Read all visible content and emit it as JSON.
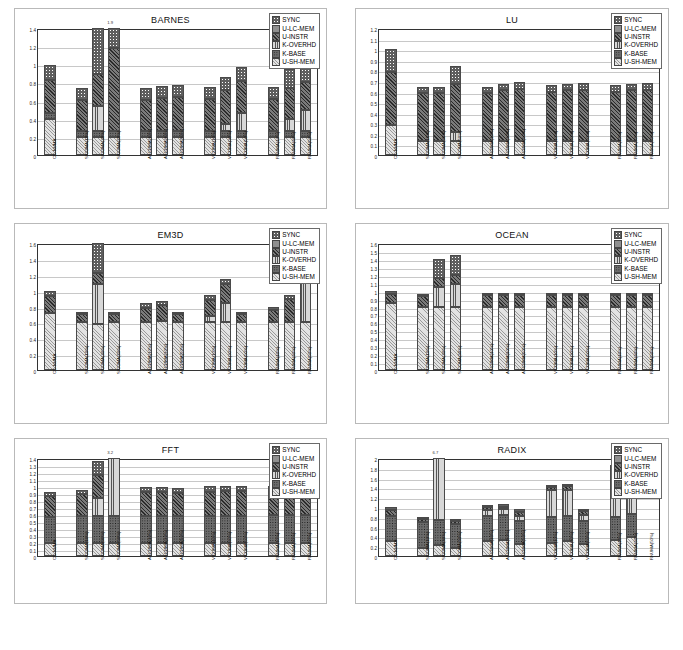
{
  "figure": {
    "background": "#ffffff",
    "panel_border": "#b9b9b9",
    "axis_color": "#333333",
    "gridline_color": "#c8c8c8"
  },
  "legend": {
    "entries": [
      {
        "key": "sync",
        "label": "SYNC",
        "swatch": "p-sync"
      },
      {
        "key": "ulc",
        "label": "U-LC-MEM",
        "swatch": "p-ulc"
      },
      {
        "key": "uin",
        "label": "U-INSTR",
        "swatch": "p-uin"
      },
      {
        "key": "kov",
        "label": "K-OVERHD",
        "swatch": "p-kov"
      },
      {
        "key": "kba",
        "label": "K-BASE",
        "swatch": "p-kba"
      },
      {
        "key": "ush",
        "label": "U-SH-MEM",
        "swatch": "p-ush"
      }
    ]
  },
  "categories": [
    "CC-NUMA",
    "SICOMA(10%)",
    "SICOMA(30%)",
    "SICOMA(50%)",
    "ASCOMA(10%)",
    "ASCOMA(30%)",
    "ASCOMA(50%)",
    "VICUMA(10%)",
    "VICUMA(30%)",
    "VICUMA(50%)",
    "RNUMA(10%)",
    "RNUMA(30%)",
    "RNUMA(50%)"
  ],
  "group_breaks": [
    1,
    4,
    7,
    10
  ],
  "chart_data": [
    {
      "type": "bar",
      "title": "BARNES",
      "xlabel": "",
      "ylabel": "",
      "ylim": [
        0,
        1.4
      ],
      "yticks": [
        0,
        0.2,
        0.4,
        0.6,
        0.8,
        1,
        1.2,
        1.4
      ],
      "ytick_labels": [
        "0",
        "0.2",
        "0.4",
        "0.6",
        "0.8",
        "1",
        "1.2",
        "1.4"
      ],
      "grid": true,
      "stacked": true,
      "series_order": [
        "ush",
        "kba",
        "kov",
        "uin",
        "ulc",
        "sync"
      ],
      "annotations": [
        {
          "text": "1.9",
          "category_index": 3
        }
      ],
      "categories": [
        "CC-NUMA",
        "SICOMA(10%)",
        "SICOMA(30%)",
        "SICOMA(50%)",
        "ASCOMA(10%)",
        "ASCOMA(30%)",
        "ASCOMA(50%)",
        "VICUMA(10%)",
        "VICUMA(30%)",
        "VICUMA(50%)",
        "RNUMA(10%)",
        "RNUMA(30%)",
        "RNUMA(50%)"
      ],
      "series": [
        {
          "name": "U-SH-MEM",
          "key": "ush",
          "values": [
            0.4,
            0.2,
            0.2,
            0.2,
            0.2,
            0.2,
            0.2,
            0.2,
            0.2,
            0.2,
            0.2,
            0.2,
            0.2
          ]
        },
        {
          "name": "K-BASE",
          "key": "kba",
          "values": [
            0.06,
            0.06,
            0.06,
            0.06,
            0.06,
            0.06,
            0.06,
            0.06,
            0.06,
            0.06,
            0.06,
            0.06,
            0.06
          ]
        },
        {
          "name": "K-OVERHD",
          "key": "kov",
          "values": [
            0.0,
            0.0,
            0.28,
            0.0,
            0.0,
            0.0,
            0.0,
            0.0,
            0.08,
            0.2,
            0.0,
            0.14,
            0.24
          ]
        },
        {
          "name": "U-INSTR",
          "key": "uin",
          "values": [
            0.37,
            0.35,
            0.35,
            0.92,
            0.35,
            0.37,
            0.38,
            0.36,
            0.38,
            0.36,
            0.36,
            0.34,
            0.3
          ]
        },
        {
          "name": "U-LC-MEM",
          "key": "ulc",
          "values": [
            0.0,
            0.0,
            0.0,
            0.0,
            0.0,
            0.0,
            0.0,
            0.0,
            0.0,
            0.0,
            0.0,
            0.0,
            0.0
          ]
        },
        {
          "name": "SYNC",
          "key": "sync",
          "values": [
            0.16,
            0.13,
            0.64,
            0.24,
            0.13,
            0.13,
            0.13,
            0.13,
            0.14,
            0.15,
            0.13,
            0.21,
            0.19
          ]
        }
      ]
    },
    {
      "type": "bar",
      "title": "LU",
      "xlabel": "",
      "ylabel": "",
      "ylim": [
        0,
        1.2
      ],
      "yticks": [
        0,
        0.1,
        0.2,
        0.3,
        0.4,
        0.5,
        0.6,
        0.7,
        0.8,
        0.9,
        1,
        1.1,
        1.2
      ],
      "ytick_labels": [
        "0",
        "0.1",
        "0.2",
        "0.3",
        "0.4",
        "0.5",
        "0.6",
        "0.7",
        "0.8",
        "0.9",
        "1",
        "1.1",
        "1.2"
      ],
      "grid": true,
      "stacked": true,
      "series_order": [
        "ush",
        "kba",
        "kov",
        "uin",
        "ulc",
        "sync"
      ],
      "annotations": [],
      "categories": [
        "CC-NUMA",
        "SICOMA(10%)",
        "SICOMA(30%)",
        "SICOMA(50%)",
        "ASCOMA(10%)",
        "ASCOMA(30%)",
        "ASCOMA(50%)",
        "VICUMA(10%)",
        "VICUMA(30%)",
        "VICUMA(50%)",
        "RNUMA(10%)",
        "RNUMA(30%)",
        "RNUMA(50%)"
      ],
      "series": [
        {
          "name": "U-SH-MEM",
          "key": "ush",
          "values": [
            0.28,
            0.13,
            0.13,
            0.13,
            0.13,
            0.13,
            0.13,
            0.13,
            0.13,
            0.13,
            0.13,
            0.13,
            0.13
          ]
        },
        {
          "name": "K-BASE",
          "key": "kba",
          "values": [
            0.0,
            0.0,
            0.0,
            0.0,
            0.0,
            0.0,
            0.0,
            0.0,
            0.0,
            0.0,
            0.0,
            0.0,
            0.0
          ]
        },
        {
          "name": "K-OVERHD",
          "key": "kov",
          "values": [
            0.0,
            0.0,
            0.0,
            0.09,
            0.0,
            0.0,
            0.0,
            0.0,
            0.0,
            0.0,
            0.0,
            0.0,
            0.0
          ]
        },
        {
          "name": "U-INSTR",
          "key": "uin",
          "values": [
            0.5,
            0.46,
            0.46,
            0.45,
            0.46,
            0.48,
            0.49,
            0.47,
            0.48,
            0.48,
            0.47,
            0.48,
            0.48
          ]
        },
        {
          "name": "U-LC-MEM",
          "key": "ulc",
          "values": [
            0.0,
            0.0,
            0.0,
            0.0,
            0.0,
            0.0,
            0.0,
            0.0,
            0.0,
            0.0,
            0.0,
            0.0,
            0.0
          ]
        },
        {
          "name": "SYNC",
          "key": "sync",
          "values": [
            0.22,
            0.05,
            0.05,
            0.17,
            0.05,
            0.06,
            0.07,
            0.06,
            0.06,
            0.07,
            0.06,
            0.06,
            0.07
          ]
        }
      ]
    },
    {
      "type": "bar",
      "title": "EM3D",
      "xlabel": "",
      "ylabel": "",
      "ylim": [
        0,
        1.6
      ],
      "yticks": [
        0,
        0.2,
        0.4,
        0.6,
        0.8,
        1,
        1.2,
        1.4,
        1.6
      ],
      "ytick_labels": [
        "0",
        "0.2",
        "0.4",
        "0.6",
        "0.8",
        "1",
        "1.2",
        "1.4",
        "1.6"
      ],
      "grid": true,
      "stacked": true,
      "series_order": [
        "ush",
        "kba",
        "kov",
        "uin",
        "ulc",
        "sync"
      ],
      "annotations": [],
      "categories": [
        "CC-NUMA",
        "SICOMA(10%)",
        "SICOMA(30%)",
        "SICOMA(50%)",
        "ASCOMA(10%)",
        "ASCOMA(30%)",
        "ASCOMA(50%)",
        "VICUMA(10%)",
        "VICUMA(30%)",
        "VICUMA(50%)",
        "RNUMA(10%)",
        "RNUMA(30%)",
        "RNUMA(50%)"
      ],
      "series": [
        {
          "name": "U-SH-MEM",
          "key": "ush",
          "values": [
            0.72,
            0.6,
            0.58,
            0.6,
            0.6,
            0.62,
            0.6,
            0.6,
            0.6,
            0.6,
            0.6,
            0.6,
            0.6
          ]
        },
        {
          "name": "K-BASE",
          "key": "kba",
          "values": [
            0.0,
            0.0,
            0.0,
            0.0,
            0.0,
            0.0,
            0.0,
            0.0,
            0.0,
            0.0,
            0.0,
            0.0,
            0.0
          ]
        },
        {
          "name": "K-OVERHD",
          "key": "kov",
          "values": [
            0.0,
            0.0,
            0.5,
            0.0,
            0.0,
            0.0,
            0.0,
            0.08,
            0.25,
            0.0,
            0.0,
            0.0,
            0.62
          ]
        },
        {
          "name": "U-INSTR",
          "key": "uin",
          "values": [
            0.21,
            0.11,
            0.14,
            0.11,
            0.18,
            0.2,
            0.11,
            0.2,
            0.23,
            0.11,
            0.15,
            0.3,
            0.22
          ]
        },
        {
          "name": "U-LC-MEM",
          "key": "ulc",
          "values": [
            0.0,
            0.0,
            0.0,
            0.0,
            0.0,
            0.0,
            0.0,
            0.0,
            0.0,
            0.0,
            0.0,
            0.0,
            0.0
          ]
        },
        {
          "name": "SYNC",
          "key": "sync",
          "values": [
            0.07,
            0.02,
            0.43,
            0.02,
            0.06,
            0.05,
            0.02,
            0.06,
            0.07,
            0.02,
            0.04,
            0.05,
            0.07
          ]
        }
      ]
    },
    {
      "type": "bar",
      "title": "OCEAN",
      "xlabel": "",
      "ylabel": "",
      "ylim": [
        0,
        1.6
      ],
      "yticks": [
        0,
        0.1,
        0.2,
        0.3,
        0.4,
        0.5,
        0.6,
        0.7,
        0.8,
        0.9,
        1,
        1.1,
        1.2,
        1.3,
        1.4,
        1.5,
        1.6
      ],
      "ytick_labels": [
        "0",
        "0.1",
        "0.2",
        "0.3",
        "0.4",
        "0.5",
        "0.6",
        "0.7",
        "0.8",
        "0.9",
        "1",
        "1.1",
        "1.2",
        "1.3",
        "1.4",
        "1.5",
        "1.6"
      ],
      "grid": true,
      "stacked": true,
      "series_order": [
        "ush",
        "kba",
        "kov",
        "uin",
        "ulc",
        "sync"
      ],
      "annotations": [],
      "categories": [
        "CC-NUMA",
        "SICOMA(10%)",
        "SICOMA(30%)",
        "SICOMA(50%)",
        "ASCOMA(10%)",
        "ASCOMA(30%)",
        "ASCOMA(50%)",
        "VICUMA(10%)",
        "VICUMA(30%)",
        "VICUMA(50%)",
        "RNUMA(10%)",
        "RNUMA(30%)",
        "RNUMA(50%)"
      ],
      "series": [
        {
          "name": "U-SH-MEM",
          "key": "ush",
          "values": [
            0.84,
            0.8,
            0.8,
            0.8,
            0.8,
            0.8,
            0.8,
            0.8,
            0.8,
            0.8,
            0.8,
            0.8,
            0.8
          ]
        },
        {
          "name": "K-BASE",
          "key": "kba",
          "values": [
            0.0,
            0.0,
            0.0,
            0.0,
            0.0,
            0.0,
            0.0,
            0.0,
            0.0,
            0.0,
            0.0,
            0.0,
            0.0
          ]
        },
        {
          "name": "K-OVERHD",
          "key": "kov",
          "values": [
            0.0,
            0.0,
            0.25,
            0.28,
            0.0,
            0.0,
            0.0,
            0.0,
            0.0,
            0.0,
            0.0,
            0.0,
            0.0
          ]
        },
        {
          "name": "U-INSTR",
          "key": "uin",
          "values": [
            0.12,
            0.13,
            0.11,
            0.12,
            0.14,
            0.14,
            0.14,
            0.14,
            0.14,
            0.14,
            0.14,
            0.14,
            0.14
          ]
        },
        {
          "name": "U-LC-MEM",
          "key": "ulc",
          "values": [
            0.0,
            0.0,
            0.0,
            0.0,
            0.0,
            0.0,
            0.0,
            0.0,
            0.0,
            0.0,
            0.0,
            0.0,
            0.0
          ]
        },
        {
          "name": "SYNC",
          "key": "sync",
          "values": [
            0.04,
            0.02,
            0.24,
            0.25,
            0.03,
            0.03,
            0.03,
            0.03,
            0.03,
            0.03,
            0.03,
            0.03,
            0.03
          ]
        }
      ]
    },
    {
      "type": "bar",
      "title": "FFT",
      "xlabel": "",
      "ylabel": "",
      "ylim": [
        0,
        1.4
      ],
      "yticks": [
        0,
        0.1,
        0.2,
        0.3,
        0.4,
        0.5,
        0.6,
        0.7,
        0.8,
        0.9,
        1,
        1.1,
        1.2,
        1.3,
        1.4
      ],
      "ytick_labels": [
        "0",
        "0.1",
        "0.2",
        "0.3",
        "0.4",
        "0.5",
        "0.6",
        "0.7",
        "0.8",
        "0.9",
        "1",
        "1.1",
        "1.2",
        "1.3",
        "1.4"
      ],
      "grid": true,
      "stacked": true,
      "series_order": [
        "ush",
        "kba",
        "kov",
        "uin",
        "ulc",
        "sync"
      ],
      "annotations": [
        {
          "text": "3.2",
          "category_index": 3
        }
      ],
      "categories": [
        "CC-NUMA",
        "SICOMA(10%)",
        "SICOMA(30%)",
        "SICOMA(50%)",
        "ASCOMA(10%)",
        "ASCOMA(30%)",
        "ASCOMA(50%)",
        "VICUMA(10%)",
        "VICUMA(30%)",
        "VICUMA(50%)",
        "RNUMA(10%)",
        "RNUMA(30%)",
        "RNUMA(50%)"
      ],
      "series": [
        {
          "name": "U-SH-MEM",
          "key": "ush",
          "values": [
            0.19,
            0.19,
            0.19,
            0.19,
            0.19,
            0.19,
            0.19,
            0.19,
            0.19,
            0.19,
            0.19,
            0.19,
            0.19
          ]
        },
        {
          "name": "K-BASE",
          "key": "kba",
          "values": [
            0.37,
            0.38,
            0.38,
            0.38,
            0.38,
            0.38,
            0.38,
            0.38,
            0.38,
            0.38,
            0.4,
            0.4,
            0.4
          ]
        },
        {
          "name": "K-OVERHD",
          "key": "kov",
          "values": [
            0.0,
            0.0,
            0.26,
            1.4,
            0.0,
            0.0,
            0.0,
            0.0,
            0.0,
            0.0,
            0.0,
            0.0,
            0.0
          ]
        },
        {
          "name": "U-INSTR",
          "key": "uin",
          "values": [
            0.3,
            0.31,
            0.33,
            0.0,
            0.34,
            0.34,
            0.33,
            0.35,
            0.36,
            0.36,
            0.34,
            0.34,
            0.34
          ]
        },
        {
          "name": "U-LC-MEM",
          "key": "ulc",
          "values": [
            0.0,
            0.0,
            0.0,
            0.0,
            0.0,
            0.0,
            0.0,
            0.0,
            0.0,
            0.0,
            0.0,
            0.0,
            0.0
          ]
        },
        {
          "name": "SYNC",
          "key": "sync",
          "values": [
            0.06,
            0.06,
            0.2,
            0.0,
            0.07,
            0.07,
            0.07,
            0.08,
            0.07,
            0.07,
            0.07,
            0.07,
            0.07
          ]
        }
      ]
    },
    {
      "type": "bar",
      "title": "RADIX",
      "xlabel": "",
      "ylabel": "",
      "ylim": [
        0,
        2
      ],
      "yticks": [
        0,
        0.2,
        0.4,
        0.6,
        0.8,
        1,
        1.2,
        1.4,
        1.6,
        1.8,
        2
      ],
      "ytick_labels": [
        "0",
        "0.2",
        "0.4",
        "0.6",
        "0.8",
        "1",
        "1.2",
        "1.4",
        "1.6",
        "1.8",
        "2"
      ],
      "grid": true,
      "stacked": true,
      "series_order": [
        "ush",
        "kba",
        "kov",
        "uin",
        "ulc",
        "sync"
      ],
      "annotations": [
        {
          "text": "6.7",
          "category_index": 2
        }
      ],
      "categories": [
        "CC-NUMA",
        "SICOMA(10%)",
        "SICOMA(30%)",
        "SICOMA(50%)",
        "ASCOMA(10%)",
        "ASCOMA(30%)",
        "ASCOMA(50%)",
        "VICUMA(10%)",
        "VICUMA(30%)",
        "VICUMA(50%)",
        "RNUMA(10%)",
        "RNUMA(30%)",
        "RNUMA(50%)"
      ],
      "series": [
        {
          "name": "U-SH-MEM",
          "key": "ush",
          "values": [
            0.31,
            0.17,
            0.22,
            0.16,
            0.31,
            0.33,
            0.24,
            0.26,
            0.3,
            0.24,
            0.32,
            0.38,
            0.0
          ]
        },
        {
          "name": "K-BASE",
          "key": "kba",
          "values": [
            0.5,
            0.53,
            0.52,
            0.49,
            0.5,
            0.5,
            0.47,
            0.53,
            0.52,
            0.48,
            0.48,
            0.48,
            0.0
          ]
        },
        {
          "name": "K-OVERHD",
          "key": "kov",
          "values": [
            0.0,
            0.0,
            1.26,
            0.0,
            0.13,
            0.12,
            0.11,
            0.55,
            0.53,
            0.12,
            0.92,
            0.95,
            0.0
          ]
        },
        {
          "name": "U-INSTR",
          "key": "uin",
          "values": [
            0.13,
            0.06,
            0.0,
            0.06,
            0.06,
            0.06,
            0.08,
            0.06,
            0.07,
            0.07,
            0.08,
            0.09,
            0.0
          ]
        },
        {
          "name": "U-LC-MEM",
          "key": "ulc",
          "values": [
            0.0,
            0.0,
            0.0,
            0.0,
            0.0,
            0.0,
            0.0,
            0.0,
            0.0,
            0.0,
            0.0,
            0.0,
            0.0
          ]
        },
        {
          "name": "SYNC",
          "key": "sync",
          "values": [
            0.06,
            0.04,
            0.0,
            0.04,
            0.05,
            0.05,
            0.05,
            0.05,
            0.05,
            0.05,
            0.05,
            0.05,
            0.0
          ]
        }
      ]
    }
  ]
}
